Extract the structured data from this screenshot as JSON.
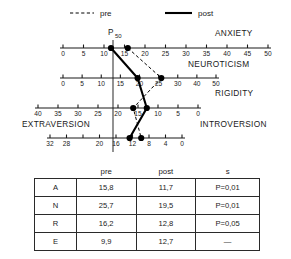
{
  "legend": {
    "pre_label": "pre",
    "post_label": "post"
  },
  "reference": {
    "label": "P",
    "sub": "50",
    "value": 50
  },
  "chart_data": {
    "type": "line",
    "title": "",
    "subtitle": "",
    "orientation": "horizontal-parallel-axes",
    "grid": false,
    "legend_position": "top",
    "series": [
      {
        "name": "pre",
        "style": "dashed",
        "values": [
          15.8,
          25.7,
          16.2,
          9.9
        ]
      },
      {
        "name": "post",
        "style": "solid",
        "values": [
          11.7,
          19.5,
          12.8,
          12.7
        ]
      }
    ],
    "axes": [
      {
        "id": "A",
        "name": "ANXIETY",
        "left_label": "",
        "right_label": "ANXIETY",
        "reversed": false,
        "range": [
          0,
          50
        ],
        "ticks": [
          0,
          5,
          10,
          15,
          20,
          25,
          30,
          35,
          40,
          45,
          50
        ],
        "tick_labels": [
          "0",
          "5",
          "10",
          "15",
          "20",
          "25",
          "30",
          "35",
          "40",
          "45",
          "50"
        ],
        "pre": 15.8,
        "post": 11.7
      },
      {
        "id": "N",
        "name": "NEUROTICISM",
        "left_label": "",
        "right_label": "NEUROTICISM",
        "reversed": false,
        "range": [
          0,
          50
        ],
        "ticks": [
          0,
          5,
          10,
          15,
          20,
          25,
          30,
          40,
          50
        ],
        "tick_labels": [
          "0",
          "5",
          "10",
          "15",
          "20",
          "25",
          "30",
          "40",
          "50"
        ],
        "pre": 25.7,
        "post": 19.5
      },
      {
        "id": "R",
        "name": "RIGIDITY",
        "left_label": "",
        "right_label": "RIGIDITY",
        "reversed": true,
        "range": [
          0,
          40
        ],
        "ticks": [
          40,
          35,
          30,
          25,
          20,
          15,
          10,
          5,
          0
        ],
        "tick_labels": [
          "40",
          "35",
          "30",
          "25",
          "20",
          "15",
          "10",
          "5",
          "0"
        ],
        "pre": 16.2,
        "post": 12.8
      },
      {
        "id": "E",
        "name": "EXTRAVERSION",
        "left_label": "EXTRAVERSION",
        "right_label": "INTROVERSION",
        "reversed": true,
        "range": [
          0,
          32
        ],
        "ticks": [
          32,
          28,
          24,
          20,
          16,
          12,
          8,
          4,
          0
        ],
        "tick_labels": [
          "32",
          "28",
          "",
          "20",
          "16",
          "12",
          "8",
          "4",
          "0"
        ],
        "pre": 9.9,
        "post": 12.7
      }
    ]
  },
  "table": {
    "columns": [
      "",
      "pre",
      "post",
      "s"
    ],
    "rows": [
      {
        "scale": "A",
        "pre": "15,8",
        "post": "11,7",
        "s": "P=0,01"
      },
      {
        "scale": "N",
        "pre": "25,7",
        "post": "19,5",
        "s": "P=0,01"
      },
      {
        "scale": "R",
        "pre": "16,2",
        "post": "12,8",
        "s": "P=0,05"
      },
      {
        "scale": "E",
        "pre": "9,9",
        "post": "12,7",
        "s": "—"
      }
    ]
  }
}
